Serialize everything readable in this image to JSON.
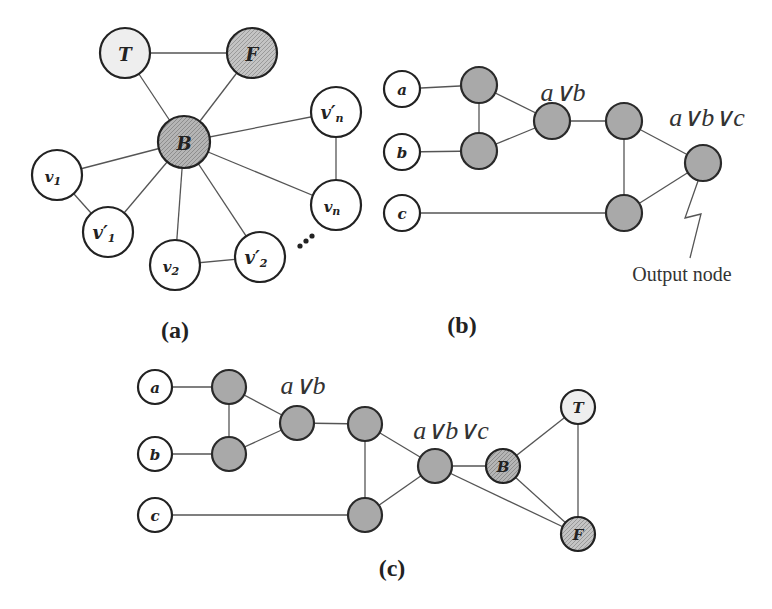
{
  "panels": {
    "a": {
      "caption": "(a)",
      "nodes": {
        "T": "T",
        "F": "F",
        "B": "B",
        "v1": "v",
        "v1_sub": "1",
        "v1p": "v′",
        "v1p_sub": "1",
        "v2": "v",
        "v2_sub": "2",
        "v2p": "v′",
        "v2p_sub": "2",
        "vn": "v",
        "vn_sub": "n",
        "vnp": "v′",
        "vnp_sub": "n"
      },
      "ellipsis": "⋯"
    },
    "b": {
      "caption": "(b)",
      "inputs": [
        "a",
        "b",
        "c"
      ],
      "expr_ab": "a∨b",
      "expr_abc": "a∨b∨c",
      "output_label": "Output node"
    },
    "c": {
      "caption": "(c)",
      "inputs": [
        "a",
        "b",
        "c"
      ],
      "expr_ab": "a∨b",
      "expr_abc": "a∨b∨c",
      "nodes": {
        "B": "B",
        "T": "T",
        "F": "F"
      }
    }
  },
  "colors": {
    "gate_fill": "#a9a9a9",
    "true_fill": "#eeeeee",
    "false_fill": "#b8b8b8",
    "base_fill": "#b0b0b0",
    "stroke": "#222222"
  }
}
